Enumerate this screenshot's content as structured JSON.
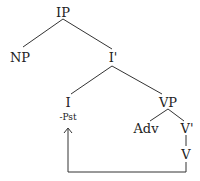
{
  "tree": {
    "nodes": {
      "ip": "IP",
      "np": "NP",
      "ibar": "I'",
      "i": "I",
      "i_feature": "-Pst",
      "vp": "VP",
      "adv": "Adv",
      "vbar": "V'",
      "v": "V"
    },
    "movement": {
      "from": "V",
      "to": "I"
    }
  }
}
